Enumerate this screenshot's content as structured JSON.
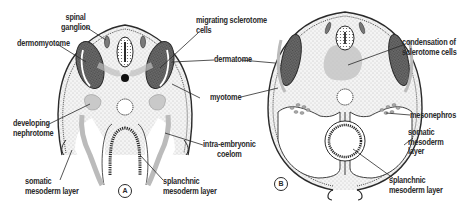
{
  "figure": {
    "panels": [
      {
        "id": "A",
        "label": "A",
        "annotations": {
          "spinal_ganglion": "spinal\nganglion",
          "dermomyotome": "dermomyotome",
          "migrating_sclerotome": "migrating sclerotome\ncells",
          "dermatome": "dermatome",
          "myotome": "myotome",
          "developing_nephrotome": "developing\nnephrotome",
          "intra_embryonic_coelom": "intra-embryonic\ncoelom",
          "somatic_mesoderm": "somatic\nmesoderm layer",
          "splanchnic_mesoderm": "splanchnic\nmesoderm layer"
        }
      },
      {
        "id": "B",
        "label": "B",
        "annotations": {
          "condensation": "condensation of\nsclerotome cells",
          "mesonephros": "mesonephros",
          "somatic_mesoderm": "somatic\nmesoderm\nlayer",
          "splanchnic_mesoderm": "splanchnic\nmesoderm layer"
        }
      }
    ],
    "colors": {
      "ink": "#2a2a2a",
      "stipple_fill": "#eeeeee",
      "somite_dark": "#555555",
      "light_gray": "#cfcfcf",
      "background": "#ffffff"
    }
  }
}
